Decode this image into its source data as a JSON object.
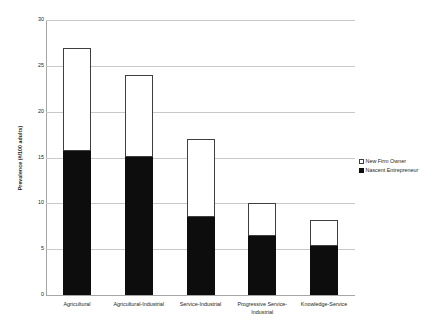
{
  "chart_data": {
    "type": "bar",
    "subtype": "stacked-vertical",
    "title": "",
    "xlabel": "",
    "ylabel": "Prevalence (#/100 adults)",
    "ylim": [
      0,
      30
    ],
    "yticks": [
      0,
      5,
      10,
      15,
      20,
      25,
      30
    ],
    "ytick_labels": [
      "0",
      "5",
      "10",
      "15",
      "20",
      "25",
      "30"
    ],
    "grid": true,
    "grid_axis": "y",
    "legend_position": "right",
    "categories": [
      "Agricultural",
      "Agricultural-Industrial",
      "Service-Industrial",
      "Progressive Service-Industrial",
      "Knowledge-Service"
    ],
    "category_lines": [
      [
        "Agricultural"
      ],
      [
        "Agricultural-Industrial"
      ],
      [
        "Service-Industrial"
      ],
      [
        "Progressive Service-",
        "Industrial"
      ],
      [
        "Knowledge-Service"
      ]
    ],
    "series": [
      {
        "name": "Nascent Entrepreneur",
        "color": "#0d0d0d",
        "marker": "filled-square",
        "values": [
          15.7,
          15.1,
          8.5,
          6.4,
          5.3
        ]
      },
      {
        "name": "New Firm Owner",
        "color": "#ffffff",
        "marker": "open-square",
        "values": [
          11.3,
          8.9,
          8.5,
          3.6,
          2.9
        ]
      }
    ],
    "totals": [
      27.0,
      24.0,
      17.0,
      10.0,
      8.2
    ]
  },
  "legend": {
    "entries": [
      {
        "label": "New Firm Owner"
      },
      {
        "label": "Nascent Entrepreneur"
      }
    ]
  }
}
